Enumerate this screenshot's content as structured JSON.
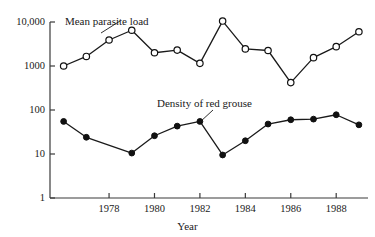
{
  "chart_data": {
    "type": "line",
    "title": "",
    "xlabel": "Year",
    "ylabel": "",
    "yscale": "log",
    "ylim": [
      1,
      10000
    ],
    "xlim": [
      1975.4,
      1989.4
    ],
    "grid": false,
    "legend_position": "inline-annotation",
    "ytick_labels": [
      "10,000",
      "1000",
      "100",
      "10",
      "1"
    ],
    "ytick_values": [
      10000,
      1000,
      100,
      10,
      1
    ],
    "xtick_labels": [
      "1978",
      "1980",
      "1982",
      "1984",
      "1986",
      "1988"
    ],
    "xtick_values": [
      1978,
      1980,
      1982,
      1984,
      1986,
      1988
    ],
    "x": [
      1976,
      1977,
      1978,
      1979,
      1980,
      1981,
      1982,
      1983,
      1984,
      1985,
      1986,
      1987,
      1988,
      1989
    ],
    "series": [
      {
        "name": "Mean parasite load",
        "marker": "open-circle",
        "values": [
          1000,
          1650,
          3900,
          6500,
          2000,
          2300,
          1150,
          10500,
          2450,
          2250,
          420,
          1550,
          2750,
          6000
        ]
      },
      {
        "name": "Density of red grouse",
        "marker": "filled-circle",
        "values": [
          55,
          24,
          null,
          10.5,
          26,
          43,
          55,
          9.5,
          20,
          48,
          60,
          62,
          78,
          46
        ]
      }
    ],
    "annotations": [
      {
        "text": "Mean parasite load",
        "x": 1977.9,
        "y": 14000
      },
      {
        "text": "Density of red grouse",
        "x": 1982.2,
        "y": 190
      }
    ]
  }
}
